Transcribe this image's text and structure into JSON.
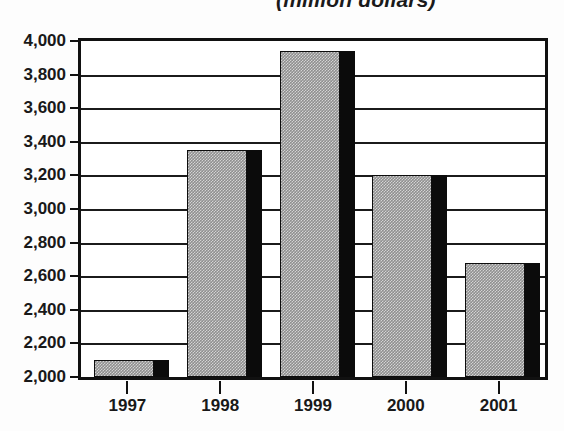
{
  "chart_data": {
    "type": "bar",
    "title": "(million dollars)",
    "title_note": "Title is clipped at the top edge of the screenshot",
    "xlabel": "",
    "ylabel": "",
    "categories": [
      "1997",
      "1998",
      "1999",
      "2000",
      "2001"
    ],
    "values": [
      2100,
      3350,
      3940,
      3205,
      2680
    ],
    "series": [
      {
        "name": "Amount",
        "values": [
          2100,
          3350,
          3940,
          3205,
          2680
        ]
      }
    ],
    "ylim": [
      2000,
      4000
    ],
    "ytick_step": 200,
    "ytick_labels": [
      "4,000",
      "3,800",
      "3,600",
      "3,400",
      "3,200",
      "3,000",
      "2,800",
      "2,600",
      "2,400",
      "2,200",
      "2,000"
    ],
    "ytick_values": [
      4000,
      3800,
      3600,
      3400,
      3200,
      3000,
      2800,
      2600,
      2400,
      2200,
      2000
    ],
    "grid": true,
    "grid_axis": "y",
    "legend": false,
    "legend_position": "none",
    "style": "3d-bar-grayscale",
    "colors": {
      "bar_face": "#8f8f8f",
      "bar_side": "#0b0b0b",
      "bar_outline": "#0d0d0d",
      "axis": "#111111",
      "gridline": "#1b1b1b",
      "text": "#191919",
      "background": "#ffffff"
    }
  }
}
